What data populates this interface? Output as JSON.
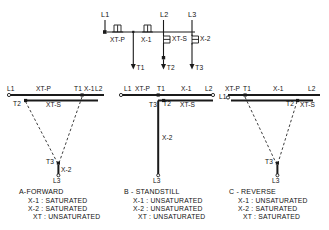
{
  "figure": {
    "background_color": "#ffffff",
    "line_color": "#1a1a1a",
    "top_circuit": {
      "supply_labels": [
        "L1",
        "L2",
        "L3"
      ],
      "components": [
        {
          "name": "XT-P",
          "type": "coil-horizontal"
        },
        {
          "name": "X-1",
          "type": "coil-horizontal"
        },
        {
          "name": "XT-S",
          "type": "coil-vertical"
        },
        {
          "name": "X-2",
          "type": "coil-vertical"
        }
      ],
      "terminals": [
        "T1",
        "T2",
        "T3"
      ],
      "label_L1": "L1",
      "label_L2": "L2",
      "label_L3": "L3",
      "label_XT_P": "XT-P",
      "label_X_1": "X-1",
      "label_XT_S": "XT-S",
      "label_X_2": "X-2",
      "label_T1": "T1",
      "label_T2": "T2",
      "label_T3": "T3"
    },
    "diagrams": [
      {
        "id": "a",
        "caption": "A-FORWARD",
        "conditions": [
          "X-1 : SATURATED",
          "X-2 : SATURATED",
          "XT : UNSATURATED"
        ],
        "vector_labels": {
          "top_left": "L1",
          "top_xt_p": "XT-P",
          "top_t1": "T1",
          "top_x1": "X-1",
          "top_right": "L2",
          "sec_t2": "T2",
          "sec_xt_s": "XT-S",
          "bottom_t3": "T3",
          "bottom_x2": "X-2",
          "bottom_l3": "L3"
        }
      },
      {
        "id": "b",
        "caption": "B - STANDSTILL",
        "conditions": [
          "X-1 : UNSATURATED",
          "X-2 : UNSATURATED",
          "XT : UNSATURATED"
        ],
        "vector_labels": {
          "top_left": "L1",
          "top_xt_p": "XT-P",
          "top_t1": "T1",
          "top_x1": "X-1",
          "top_right": "L2",
          "sec_t3": "T3",
          "sec_t2": "T2",
          "sec_xt_s": "XT-S",
          "mid_x2": "X-2",
          "bottom_l3": "L3"
        }
      },
      {
        "id": "c",
        "caption": "C - REVERSE",
        "conditions": [
          "X-1 : UNSATURATED",
          "X-2 : SATURATED",
          "XT : SATURATED"
        ],
        "vector_labels": {
          "top_left": "L1",
          "top_xt_p": "XT-P",
          "top_t1": "T1",
          "top_x1": "X-1",
          "top_right": "L2",
          "sec_t2": "T2",
          "sec_xt_s": "XT-S",
          "bottom_t3": "T3",
          "bottom_l3": "L3"
        }
      }
    ]
  }
}
